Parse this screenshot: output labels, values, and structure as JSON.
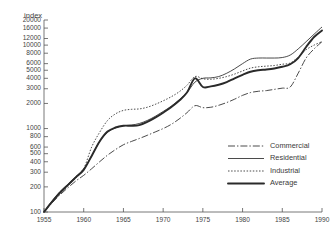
{
  "chart_data": {
    "type": "line",
    "title": "",
    "subtitle": "",
    "xlabel": "",
    "ylabel": "index",
    "yscale": "log",
    "ylim": [
      100,
      22000
    ],
    "xlim": [
      1955,
      1990
    ],
    "grid": false,
    "legend_position": "lower-right",
    "ytick_labels": [
      "20000",
      "16000",
      "12000",
      "10000",
      "8000",
      "6000",
      "5000",
      "4000",
      "3000",
      "2000",
      "1000",
      "800",
      "600",
      "500",
      "400",
      "300",
      "200",
      "100"
    ],
    "ytick_values": [
      20000,
      16000,
      12000,
      10000,
      8000,
      6000,
      5000,
      4000,
      3000,
      2000,
      1000,
      800,
      600,
      500,
      400,
      300,
      200,
      100
    ],
    "xtick_labels": [
      "1955",
      "1960",
      "1965",
      "1970",
      "1975",
      "1980",
      "1985",
      "1990"
    ],
    "xtick_values": [
      1955,
      1960,
      1965,
      1970,
      1975,
      1980,
      1985,
      1990
    ],
    "x": [
      1955,
      1956,
      1957,
      1958,
      1959,
      1960,
      1961,
      1962,
      1963,
      1964,
      1965,
      1966,
      1967,
      1968,
      1969,
      1970,
      1971,
      1972,
      1973,
      1974,
      1975,
      1976,
      1977,
      1978,
      1979,
      1980,
      1981,
      1982,
      1983,
      1984,
      1985,
      1986,
      1987,
      1988,
      1989,
      1990
    ],
    "series": [
      {
        "name": "Commercial",
        "style": "dash-dot",
        "values": [
          100,
          128,
          160,
          195,
          235,
          275,
          330,
          400,
          480,
          560,
          640,
          700,
          760,
          830,
          910,
          1000,
          1120,
          1300,
          1550,
          1880,
          1780,
          1800,
          1900,
          2050,
          2250,
          2500,
          2700,
          2800,
          2850,
          2950,
          3050,
          3150,
          4600,
          7000,
          9000,
          11000
        ]
      },
      {
        "name": "Residential",
        "style": "solid-thin",
        "values": [
          100,
          135,
          175,
          215,
          265,
          330,
          470,
          700,
          900,
          1020,
          1080,
          1100,
          1150,
          1250,
          1400,
          1600,
          1850,
          2200,
          2700,
          3600,
          4000,
          4050,
          4200,
          4600,
          5200,
          6000,
          6800,
          7000,
          7000,
          7000,
          7100,
          7600,
          9000,
          11000,
          13500,
          16500
        ]
      },
      {
        "name": "Industrial",
        "style": "dotted",
        "values": [
          100,
          130,
          165,
          205,
          255,
          330,
          600,
          900,
          1250,
          1500,
          1650,
          1700,
          1720,
          1800,
          1950,
          2150,
          2400,
          2750,
          3300,
          4200,
          3950,
          3900,
          4000,
          4200,
          4500,
          4900,
          5300,
          5500,
          5600,
          5700,
          5900,
          6100,
          7200,
          8800,
          10000,
          11000
        ]
      },
      {
        "name": "Average",
        "style": "solid-thick",
        "values": [
          100,
          132,
          170,
          210,
          260,
          320,
          470,
          700,
          920,
          1030,
          1080,
          1080,
          1100,
          1200,
          1350,
          1550,
          1800,
          2150,
          2700,
          4000,
          3150,
          3200,
          3350,
          3600,
          4000,
          4400,
          4800,
          5000,
          5100,
          5250,
          5500,
          5900,
          7000,
          9500,
          12500,
          15000
        ]
      }
    ]
  },
  "legend": {
    "items": [
      {
        "label": "Commercial"
      },
      {
        "label": "Residential"
      },
      {
        "label": "Industrial"
      },
      {
        "label": "Average"
      }
    ]
  }
}
